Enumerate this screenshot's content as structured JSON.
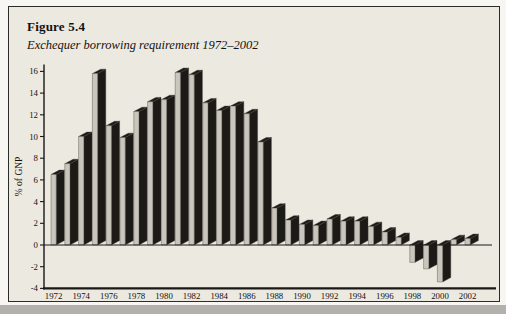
{
  "figure": {
    "number": "Figure 5.4",
    "caption": "Exchequer borrowing requirement 1972–2002"
  },
  "chart_data": {
    "type": "bar",
    "style": "3d-columns",
    "title": "Exchequer borrowing requirement 1972–2002",
    "xlabel": "",
    "ylabel": "% of GNP",
    "ylim": [
      -4,
      16
    ],
    "ytick_step": 2,
    "ytick_labels": [
      "-4",
      "-2",
      "0",
      "2",
      "4",
      "6",
      "8",
      "10",
      "12",
      "14",
      "16"
    ],
    "xtick_labels": [
      "1972",
      "1974",
      "1976",
      "1978",
      "1980",
      "1982",
      "1984",
      "1986",
      "1988",
      "1990",
      "1992",
      "1994",
      "1996",
      "1998",
      "2000",
      "2002"
    ],
    "grid": false,
    "legend": null,
    "categories": [
      1972,
      1973,
      1974,
      1975,
      1976,
      1977,
      1978,
      1979,
      1980,
      1981,
      1982,
      1983,
      1984,
      1985,
      1986,
      1987,
      1988,
      1989,
      1990,
      1991,
      1992,
      1993,
      1994,
      1995,
      1996,
      1997,
      1998,
      1999,
      2000,
      2001,
      2002
    ],
    "values": [
      6.5,
      7.5,
      10.0,
      15.8,
      11.0,
      9.9,
      12.3,
      13.2,
      13.4,
      15.9,
      15.7,
      13.1,
      12.4,
      12.8,
      12.1,
      9.5,
      3.4,
      2.3,
      1.9,
      1.8,
      2.4,
      2.2,
      2.2,
      1.7,
      1.2,
      0.7,
      -1.6,
      -2.2,
      -3.4,
      0.5,
      0.6
    ]
  },
  "colors": {
    "panel_background": "#ece9e0",
    "frame_border": "#2b2b28",
    "bar_side_top": "#1c1a17",
    "bar_front": "#c9c6bd",
    "bar_outline": "#44413b",
    "axis": "#1a1816",
    "text": "#141210",
    "page_edge": "#b3b1ab"
  }
}
